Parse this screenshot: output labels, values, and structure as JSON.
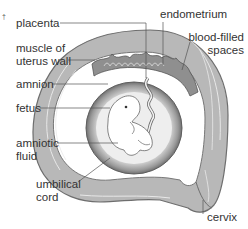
{
  "figure": {
    "labels": {
      "placenta": "placenta",
      "muscle_line1": "muscle of",
      "muscle_line2": "uterus wall",
      "amnion": "amnion",
      "fetus": "fetus",
      "amniotic_line1": "amniotic",
      "amniotic_line2": "fluid",
      "umbilical_line1": "umbilical",
      "umbilical_line2": "cord",
      "endometrium": "endometrium",
      "blood_line1": "blood-filled",
      "blood_line2": "spaces",
      "cervix": "cervix"
    },
    "corner_mark": "†",
    "colors": {
      "uterus_wall": "#b5b5b5",
      "uterus_outline": "#7a7a7a",
      "endometrium": "#8c8c8c",
      "amniotic_sac": "#9a9a9a",
      "fluid": "#e6e6e6",
      "fetus": "#ffffff",
      "text": "#333333",
      "leader": "#555555"
    }
  }
}
